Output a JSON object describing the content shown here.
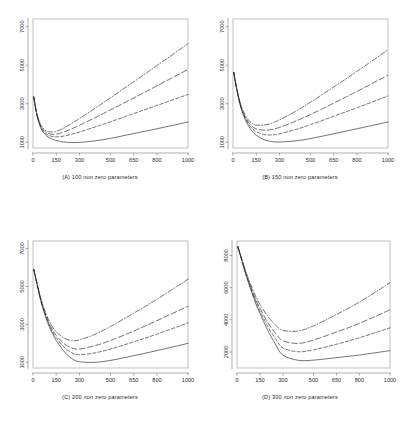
{
  "figure": {
    "title": "",
    "panel_count": 4,
    "layout": "2x2 grid of line charts"
  },
  "chart_data": [
    {
      "type": "line",
      "panel": "A",
      "title": "(A) 100 non zero parameters",
      "xlabel": "",
      "ylabel": "",
      "xlim": [
        0,
        1000
      ],
      "ylim": [
        700,
        7400
      ],
      "xticks": [
        0,
        150,
        300,
        500,
        650,
        800,
        1000
      ],
      "xticklabels": [
        "0",
        "150",
        "300",
        "500",
        "650",
        "800",
        "1000"
      ],
      "yticks": [
        1000,
        3000,
        5000,
        7000
      ],
      "yticklabels": [
        "1000",
        "3000",
        "5000",
        "7000"
      ],
      "grid": false,
      "legend": "none",
      "x": [
        5,
        25,
        50,
        75,
        100,
        125,
        150,
        200,
        250,
        300,
        400,
        500,
        650,
        800,
        1000
      ],
      "series": [
        {
          "name": "solid",
          "style": "solid",
          "values": [
            3350,
            2400,
            1750,
            1430,
            1260,
            1160,
            1095,
            1010,
            985,
            990,
            1070,
            1200,
            1450,
            1700,
            2050
          ]
        },
        {
          "name": "dashed",
          "style": "dashed",
          "values": [
            3350,
            2420,
            1800,
            1500,
            1360,
            1300,
            1280,
            1320,
            1420,
            1530,
            1790,
            2060,
            2490,
            2910,
            3480
          ]
        },
        {
          "name": "long-dash",
          "style": "longdash",
          "values": [
            3350,
            2450,
            1850,
            1570,
            1450,
            1410,
            1420,
            1530,
            1700,
            1880,
            2270,
            2680,
            3300,
            3930,
            4780
          ]
        },
        {
          "name": "dash-dot",
          "style": "dashdot",
          "values": [
            3350,
            2480,
            1900,
            1640,
            1545,
            1530,
            1560,
            1740,
            1980,
            2230,
            2760,
            3310,
            4140,
            4980,
            6120
          ]
        }
      ]
    },
    {
      "type": "line",
      "panel": "B",
      "title": "(B) 150 non zero parameters",
      "xlabel": "",
      "ylabel": "",
      "xlim": [
        0,
        1000
      ],
      "ylim": [
        700,
        7400
      ],
      "xticks": [
        0,
        150,
        300,
        500,
        650,
        800,
        1000
      ],
      "xticklabels": [
        "0",
        "150",
        "300",
        "500",
        "650",
        "800",
        "1000"
      ],
      "yticks": [
        1000,
        3000,
        5000,
        7000
      ],
      "yticklabels": [
        "1000",
        "3000",
        "5000",
        "7000"
      ],
      "grid": false,
      "legend": "none",
      "x": [
        5,
        25,
        50,
        75,
        100,
        125,
        150,
        200,
        250,
        300,
        400,
        500,
        650,
        800,
        1000
      ],
      "series": [
        {
          "name": "solid",
          "style": "solid",
          "values": [
            4620,
            3700,
            2820,
            2250,
            1850,
            1560,
            1370,
            1130,
            1035,
            1010,
            1070,
            1190,
            1440,
            1700,
            2050
          ]
        },
        {
          "name": "dashed",
          "style": "dashed",
          "values": [
            4620,
            3720,
            2860,
            2320,
            1950,
            1700,
            1550,
            1400,
            1380,
            1440,
            1650,
            1910,
            2350,
            2790,
            3400
          ]
        },
        {
          "name": "long-dash",
          "style": "longdash",
          "values": [
            4620,
            3740,
            2900,
            2380,
            2040,
            1820,
            1700,
            1620,
            1660,
            1770,
            2080,
            2440,
            3030,
            3640,
            4480
          ]
        },
        {
          "name": "dash-dot",
          "style": "dashdot",
          "values": [
            4620,
            3760,
            2950,
            2460,
            2150,
            1970,
            1890,
            1890,
            1990,
            2160,
            2590,
            3080,
            3870,
            4680,
            5800
          ]
        }
      ]
    },
    {
      "type": "line",
      "panel": "C",
      "title": "(C) 200 non zero parameters",
      "xlabel": "",
      "ylabel": "",
      "xlim": [
        0,
        1000
      ],
      "ylim": [
        700,
        7400
      ],
      "xticks": [
        0,
        150,
        300,
        500,
        650,
        800,
        1000
      ],
      "xticklabels": [
        "0",
        "150",
        "300",
        "500",
        "650",
        "800",
        "1000"
      ],
      "yticks": [
        1000,
        3000,
        5000,
        7000
      ],
      "yticklabels": [
        "1000",
        "3000",
        "5000",
        "7000"
      ],
      "grid": false,
      "legend": "none",
      "x": [
        5,
        25,
        50,
        75,
        100,
        125,
        150,
        200,
        250,
        300,
        400,
        500,
        650,
        800,
        1000
      ],
      "series": [
        {
          "name": "solid",
          "style": "solid",
          "values": [
            5900,
            5150,
            4250,
            3550,
            2980,
            2520,
            2150,
            1580,
            1200,
            1030,
            1000,
            1100,
            1350,
            1620,
            2000
          ]
        },
        {
          "name": "dashed",
          "style": "dashed",
          "values": [
            5900,
            5170,
            4290,
            3610,
            3060,
            2630,
            2290,
            1800,
            1500,
            1400,
            1500,
            1700,
            2080,
            2490,
            3080
          ]
        },
        {
          "name": "long-dash",
          "style": "longdash",
          "values": [
            5900,
            5190,
            4330,
            3670,
            3140,
            2730,
            2420,
            1990,
            1760,
            1700,
            1880,
            2150,
            2650,
            3200,
            3960
          ]
        },
        {
          "name": "dash-dot",
          "style": "dashdot",
          "values": [
            5900,
            5210,
            4380,
            3750,
            3250,
            2880,
            2610,
            2280,
            2150,
            2180,
            2480,
            2890,
            3590,
            4330,
            5380
          ]
        }
      ]
    },
    {
      "type": "line",
      "panel": "D",
      "title": "(D) 300 non zero parameters",
      "xlabel": "",
      "ylabel": "",
      "xlim": [
        0,
        1000
      ],
      "ylim": [
        1000,
        8900
      ],
      "xticks": [
        0,
        150,
        300,
        500,
        650,
        800,
        1000
      ],
      "xticklabels": [
        "0",
        "150",
        "300",
        "500",
        "650",
        "800",
        "1000"
      ],
      "yticks": [
        2000,
        4000,
        6000,
        8000
      ],
      "yticklabels": [
        "2000",
        "4000",
        "6000",
        "8000"
      ],
      "grid": false,
      "legend": "none",
      "x": [
        5,
        25,
        50,
        75,
        100,
        125,
        150,
        200,
        250,
        300,
        400,
        500,
        650,
        800,
        1000
      ],
      "series": [
        {
          "name": "solid",
          "style": "solid",
          "values": [
            8550,
            7900,
            7050,
            6300,
            5600,
            4950,
            4400,
            3350,
            2500,
            1800,
            1480,
            1490,
            1640,
            1810,
            2080
          ]
        },
        {
          "name": "dashed",
          "style": "dashed",
          "values": [
            8550,
            7920,
            7100,
            6370,
            5700,
            5080,
            4560,
            3600,
            2850,
            2250,
            2010,
            2130,
            2480,
            2880,
            3500
          ]
        },
        {
          "name": "long-dash",
          "style": "longdash",
          "values": [
            8550,
            7950,
            7150,
            6440,
            5800,
            5210,
            4720,
            3850,
            3180,
            2690,
            2530,
            2740,
            3240,
            3780,
            4620
          ]
        },
        {
          "name": "dash-dot",
          "style": "dashdot",
          "values": [
            8550,
            7980,
            7220,
            6540,
            5940,
            5400,
            4960,
            4220,
            3690,
            3340,
            3300,
            3620,
            4330,
            5100,
            6300
          ]
        }
      ]
    }
  ]
}
